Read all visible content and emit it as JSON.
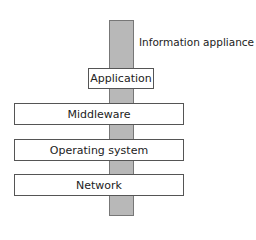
{
  "diagram": {
    "bar_label": "Information appliance",
    "layers": [
      {
        "label": "Application"
      },
      {
        "label": "Middleware"
      },
      {
        "label": "Operating system"
      },
      {
        "label": "Network"
      }
    ],
    "colors": {
      "bar": "#b8b8b8",
      "box_fill": "#ffffff",
      "border": "#555555"
    }
  }
}
